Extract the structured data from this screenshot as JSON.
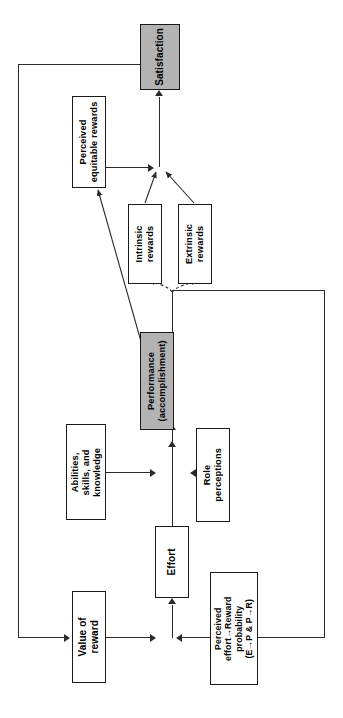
{
  "figure": {
    "orientation": "rotated-90-ccw",
    "line_color": "#2b2b2b",
    "box_border_color": "#1a1a1a",
    "highlight_fill": "#b3b3b3",
    "background": "#ffffff"
  },
  "nodes": {
    "satisfaction": {
      "label": "Satisfaction",
      "filled": true
    },
    "perceived_equitable_rewards": {
      "label": "Perceived\nequitable rewards",
      "filled": false
    },
    "intrinsic_rewards": {
      "label": "Intrinsic\nrewards",
      "filled": false
    },
    "extrinsic_rewards": {
      "label": "Extrinsic\nrewards",
      "filled": false
    },
    "performance": {
      "label": "Performance\n(accomplishment)",
      "filled": true
    },
    "abilities": {
      "label": "Abilities,\nskills, and\nknowledge",
      "filled": false
    },
    "role_perceptions": {
      "label": "Role\nperceptions",
      "filled": false
    },
    "effort": {
      "label": "Effort",
      "filled": false
    },
    "value_of_reward": {
      "label": "Value of\nreward",
      "filled": false
    },
    "perceived_probability": {
      "label": "Perceived\neffort→Reward\nprobability\n(E→P & P→R)",
      "filled": false
    }
  },
  "edges": [
    {
      "from": "value_of_reward",
      "to": "effort"
    },
    {
      "from": "perceived_probability",
      "to": "effort"
    },
    {
      "from": "effort",
      "to": "performance"
    },
    {
      "from": "abilities",
      "to": "performance"
    },
    {
      "from": "role_perceptions",
      "to": "performance"
    },
    {
      "from": "performance",
      "to": "intrinsic_rewards",
      "style": "dashed"
    },
    {
      "from": "performance",
      "to": "extrinsic_rewards",
      "style": "dashed"
    },
    {
      "from": "performance",
      "to": "perceived_equitable_rewards"
    },
    {
      "from": "intrinsic_rewards",
      "to": "satisfaction"
    },
    {
      "from": "extrinsic_rewards",
      "to": "satisfaction"
    },
    {
      "from": "perceived_equitable_rewards",
      "to": "satisfaction"
    },
    {
      "from": "satisfaction",
      "to": "value_of_reward",
      "style": "feedback"
    },
    {
      "from": "performance",
      "to": "perceived_probability",
      "style": "feedback"
    }
  ]
}
